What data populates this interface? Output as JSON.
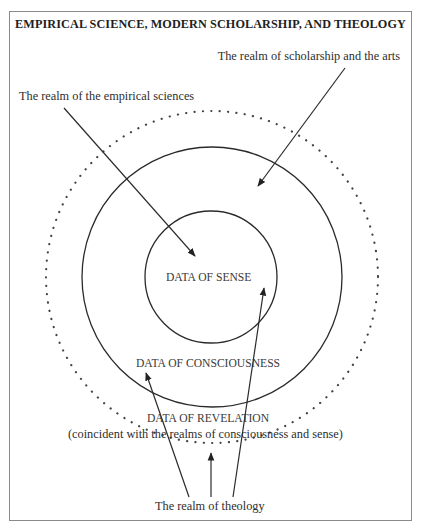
{
  "title": "EMPIRICAL SCIENCE, MODERN SCHOLARSHIP, AND THEOLOGY",
  "labels": {
    "scholarship": "The realm of scholarship and the arts",
    "empirical": "The realm of the empirical sciences",
    "sense": "DATA OF SENSE",
    "consciousness": "DATA OF CONSCIOUSNESS",
    "revelation": "DATA OF REVELATION",
    "revelation_note": "(coincident with the realms of consciousness and sense)",
    "theology": "The realm of theology"
  },
  "diagram": {
    "circles": [
      {
        "name": "sense",
        "cx": 211,
        "cy": 277,
        "r": 66,
        "style": "solid"
      },
      {
        "name": "consciousness",
        "cx": 212,
        "cy": 277,
        "r": 130,
        "style": "solid"
      },
      {
        "name": "revelation",
        "cx": 212,
        "cy": 277,
        "r": 166,
        "style": "dotted"
      }
    ],
    "arrows": [
      {
        "from": "The realm of the empirical sciences",
        "to": "DATA OF SENSE"
      },
      {
        "from": "The realm of scholarship and the arts",
        "to": "DATA OF CONSCIOUSNESS"
      },
      {
        "from": "The realm of theology",
        "to": "DATA OF CONSCIOUSNESS"
      },
      {
        "from": "The realm of theology",
        "to": "DATA OF REVELATION"
      },
      {
        "from": "The realm of theology",
        "to": "DATA OF SENSE"
      }
    ],
    "colors": {
      "stroke": "#2a2a2a",
      "frame": "#8a8a8a",
      "background": "#ffffff"
    }
  }
}
